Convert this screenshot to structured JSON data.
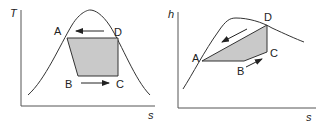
{
  "colors": {
    "line": "#333333",
    "fill": "#c9c9c9",
    "background": "#ffffff"
  },
  "diagrams": [
    {
      "id": "T-s",
      "y_axis_label": "T",
      "x_axis_label": "s",
      "points": {
        "A": "A",
        "B": "B",
        "C": "C",
        "D": "D"
      },
      "process_arrows": [
        "D to A (leftward, top)",
        "B to C (rightward, bottom)"
      ]
    },
    {
      "id": "h-s",
      "y_axis_label": "h",
      "x_axis_label": "s",
      "points": {
        "A": "A",
        "B": "B",
        "C": "C",
        "D": "D"
      },
      "process_arrows": [
        "D to A (diagonal, down-left)",
        "B to C (up-right)"
      ]
    }
  ]
}
